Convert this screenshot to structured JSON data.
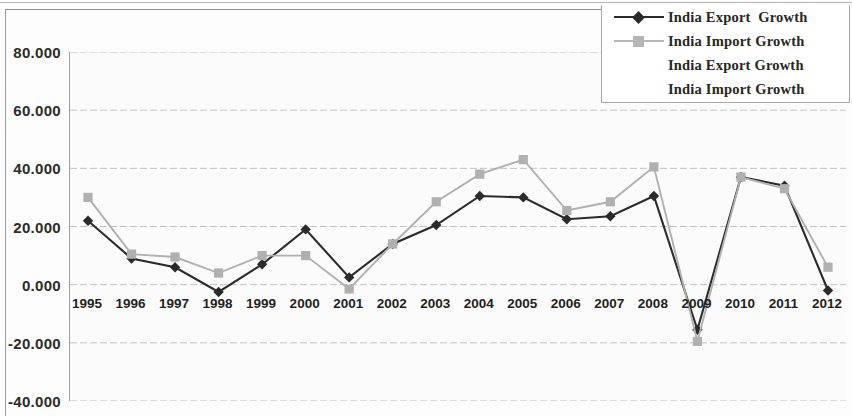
{
  "chart_data": {
    "type": "line",
    "title": "",
    "xlabel": "",
    "ylabel": "",
    "grid": true,
    "legend_position": "top-right",
    "categories": [
      "1995",
      "1996",
      "1997",
      "1998",
      "1999",
      "2000",
      "2001",
      "2002",
      "2003",
      "2004",
      "2005",
      "2006",
      "2007",
      "2008",
      "2009",
      "2010",
      "2011",
      "2012"
    ],
    "ylim": [
      -40,
      80
    ],
    "yticks": [
      "80.000",
      "60.000",
      "40.000",
      "20.000",
      "0.000",
      "-20.000",
      "-40.000"
    ],
    "ytick_values": [
      80,
      60,
      40,
      20,
      0,
      -20,
      -40
    ],
    "series": [
      {
        "name": "India Export  Growth",
        "color": "#2b2b2b",
        "marker": "diamond",
        "values": [
          22.0,
          9.0,
          6.0,
          -2.5,
          7.0,
          19.0,
          2.5,
          14.0,
          20.5,
          30.5,
          30.0,
          22.5,
          23.5,
          30.5,
          -15.5,
          37.0,
          34.0,
          -2.0
        ]
      },
      {
        "name": "India Import Growth",
        "color": "#b0b0b0",
        "marker": "square",
        "values": [
          30.0,
          10.5,
          9.5,
          4.0,
          10.0,
          10.0,
          -1.5,
          14.0,
          28.5,
          38.0,
          43.0,
          25.5,
          28.5,
          40.5,
          -19.5,
          37.0,
          33.0,
          6.0
        ]
      }
    ]
  },
  "legend": {
    "entries": [
      {
        "label": "India Export  Growth",
        "has_key": true,
        "marker": "diamond",
        "color": "#2b2b2b"
      },
      {
        "label": "India Import Growth",
        "has_key": true,
        "marker": "square",
        "color": "#b6b6b6"
      },
      {
        "label": "India Export Growth",
        "has_key": false,
        "marker": "none",
        "color": "#262626"
      },
      {
        "label": "India Import Growth",
        "has_key": false,
        "marker": "none",
        "color": "#262626"
      }
    ]
  }
}
